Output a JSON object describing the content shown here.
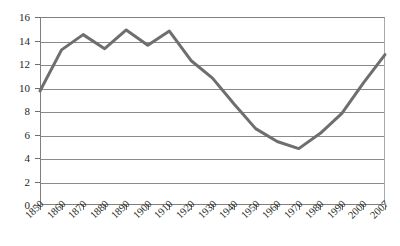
{
  "chart_data": {
    "type": "line",
    "title": "",
    "subtitle": "",
    "xlabel": "",
    "ylabel": "",
    "categories": [
      "1850",
      "1860",
      "1870",
      "1880",
      "1890",
      "1900",
      "1910",
      "1920",
      "1930",
      "1940",
      "1950",
      "1960",
      "1970",
      "1980",
      "1990",
      "2000",
      "2007"
    ],
    "values": [
      9.7,
      13.2,
      14.5,
      13.3,
      14.9,
      13.6,
      14.8,
      12.3,
      10.8,
      8.6,
      6.5,
      5.4,
      4.8,
      6.1,
      7.8,
      10.4,
      12.8
    ],
    "series": [
      {
        "name": "series-1",
        "values": [
          9.7,
          13.2,
          14.5,
          13.3,
          14.9,
          13.6,
          14.8,
          12.3,
          10.8,
          8.6,
          6.5,
          5.4,
          4.8,
          6.1,
          7.8,
          10.4,
          12.8
        ],
        "color": "#6e6e6e"
      }
    ],
    "ylim": [
      0,
      16
    ],
    "y_ticks": [
      0,
      2,
      4,
      6,
      8,
      10,
      12,
      14,
      16
    ],
    "y_tick_labels": [
      "0",
      "2",
      "4",
      "6",
      "8",
      "10",
      "12",
      "14",
      "16"
    ],
    "x_tick_labels": [
      "1850",
      "1860",
      "1870",
      "1880",
      "1890",
      "1900",
      "1910",
      "1920",
      "1930",
      "1940",
      "1950",
      "1960",
      "1970",
      "1980",
      "1990",
      "2000",
      "2007"
    ],
    "grid": true,
    "grid_axis": "y",
    "legend": false,
    "legend_position": "none",
    "line_color": "#6e6e6e",
    "line_width": 3,
    "grid_color": "#8a8a8a",
    "axis_color": "#808080",
    "background_color": "#ffffff",
    "text_color": "#231f20",
    "x_label_rotation": -45
  }
}
